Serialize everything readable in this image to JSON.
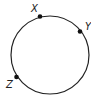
{
  "diagram": {
    "type": "circle-with-points",
    "circle": {
      "cx": 50,
      "cy": 55,
      "r": 39,
      "stroke": "#222222"
    },
    "points": [
      {
        "label": "X",
        "x": 40,
        "y": 16.5,
        "label_x": 31,
        "label_y": 12
      },
      {
        "label": "Y",
        "x": 80,
        "y": 31.5,
        "label_x": 85,
        "label_y": 30
      },
      {
        "label": "Z",
        "x": 16.5,
        "y": 77,
        "label_x": 6,
        "label_y": 88
      }
    ]
  }
}
